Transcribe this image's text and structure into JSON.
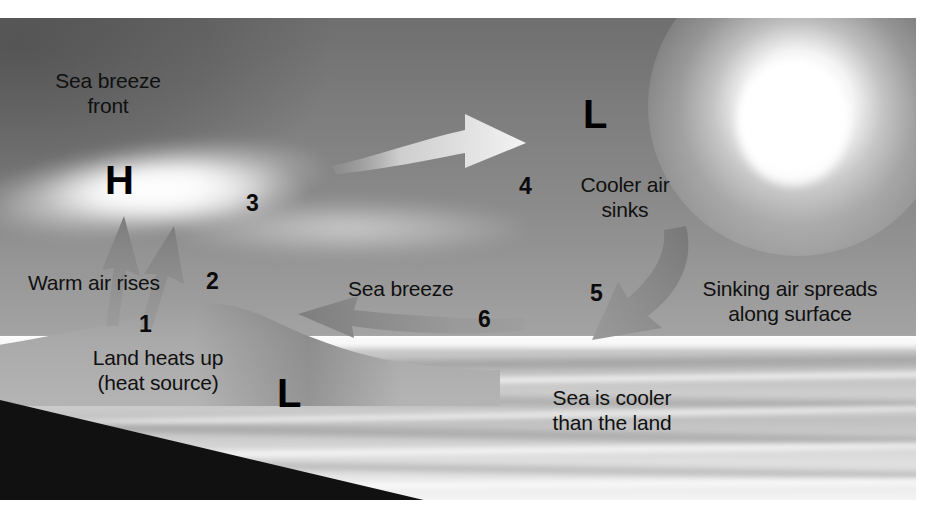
{
  "diagram": {
    "labels": {
      "sea_breeze_front": "Sea breeze\nfront",
      "warm_air_rises": "Warm air rises",
      "land_heats_up": "Land heats up\n(heat source)",
      "cooler_air_sinks": "Cooler air\nsinks",
      "sinking_air_spreads": "Sinking air spreads\nalong surface",
      "sea_breeze": "Sea breeze",
      "sea_is_cooler": "Sea is cooler\nthan the land"
    },
    "pressure_markers": [
      {
        "id": "high-land",
        "symbol": "H"
      },
      {
        "id": "low-sky",
        "symbol": "L"
      },
      {
        "id": "low-sea",
        "symbol": "L"
      }
    ],
    "step_numbers": {
      "one": "1",
      "two": "2",
      "three": "3",
      "four": "4",
      "five": "5",
      "six": "6"
    },
    "arrows": [
      {
        "id": "warm-air-rise-left",
        "direction": "up"
      },
      {
        "id": "warm-air-rise-right",
        "direction": "up"
      },
      {
        "id": "upper-return-flow",
        "direction": "right"
      },
      {
        "id": "cooler-air-sinking",
        "direction": "down-left"
      },
      {
        "id": "sea-breeze-inflow",
        "direction": "left"
      }
    ],
    "colors": {
      "arrow_gray": "#8a8a8a",
      "arrow_light": "#ececec",
      "sky_top": "#6f6f6f",
      "sky_bottom": "#b6b6b6",
      "land_dark": "#111111",
      "text": "#101010"
    }
  }
}
